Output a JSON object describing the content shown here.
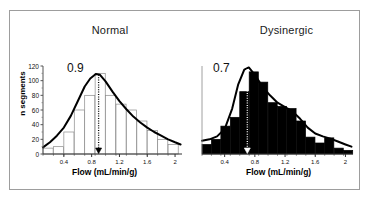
{
  "figure": {
    "background": "#ffffff",
    "border_color": "#9d9d9d"
  },
  "chart_data": [
    {
      "type": "bar",
      "title": "Normal",
      "xlabel": "Flow (mL/min/g)",
      "ylabel": "n segments",
      "xlim": [
        0.1,
        2.1
      ],
      "ylim": [
        0,
        120
      ],
      "xticks": [
        "0.4",
        "0.8",
        "1.2",
        "1.6",
        "2"
      ],
      "xtick_values": [
        0.4,
        0.8,
        1.2,
        1.6,
        2
      ],
      "yticks": [
        "0",
        "20",
        "40",
        "60",
        "80",
        "100",
        "120"
      ],
      "ytick_values": [
        0,
        20,
        40,
        60,
        80,
        100,
        120
      ],
      "grid": false,
      "legend": "none",
      "bar_fill": "#ffffff",
      "bar_edge": "#8a8a8a",
      "bin_width": 0.15,
      "bin_starts": [
        0.1,
        0.25,
        0.4,
        0.55,
        0.7,
        0.85,
        1.0,
        1.15,
        1.3,
        1.45,
        1.6,
        1.75,
        1.9
      ],
      "categories": [
        "0.10-0.25",
        "0.25-0.40",
        "0.40-0.55",
        "0.55-0.70",
        "0.70-0.85",
        "0.85-1.00",
        "1.00-1.15",
        "1.15-1.30",
        "1.30-1.45",
        "1.45-1.60",
        "1.60-1.75",
        "1.75-1.90",
        "1.90-2.05"
      ],
      "values": [
        8,
        10,
        30,
        60,
        80,
        110,
        80,
        68,
        60,
        45,
        32,
        20,
        13
      ],
      "curve": {
        "name": "smoothed distribution",
        "color": "#000000",
        "x": [
          0.1,
          0.2,
          0.3,
          0.4,
          0.5,
          0.6,
          0.7,
          0.78,
          0.86,
          0.92,
          1.0,
          1.1,
          1.2,
          1.3,
          1.4,
          1.5,
          1.6,
          1.7,
          1.8,
          1.9,
          2.0,
          2.08
        ],
        "y": [
          9,
          16,
          25,
          36,
          52,
          72,
          92,
          103,
          109,
          108,
          99,
          85,
          72,
          61,
          51,
          43,
          36,
          30,
          25,
          20,
          16,
          13
        ]
      },
      "annotation": {
        "label": "0.9",
        "marker": "dotted-arrow-down",
        "x_value": 0.9,
        "color": "#000000",
        "fill": "black"
      }
    },
    {
      "type": "bar",
      "title": "Dysinergic",
      "xlabel": "Flow (mL/min/g)",
      "ylabel": "",
      "xlim": [
        0.1,
        2.1
      ],
      "ylim": [
        0,
        120
      ],
      "xticks": [
        "0.4",
        "0.8",
        "1.2",
        "1.6",
        "2"
      ],
      "xtick_values": [
        0.4,
        0.8,
        1.2,
        1.6,
        2
      ],
      "yticks": [],
      "ytick_values": [
        0,
        20,
        40,
        60,
        80,
        100,
        120
      ],
      "grid": false,
      "legend": "none",
      "bar_fill": "#000000",
      "bar_edge": "#000000",
      "bin_width": 0.125,
      "bin_starts": [
        0.1,
        0.225,
        0.35,
        0.475,
        0.6,
        0.725,
        0.85,
        0.975,
        1.1,
        1.225,
        1.35,
        1.475,
        1.6,
        1.725,
        1.85,
        1.975
      ],
      "categories": [
        "0.10-0.23",
        "0.23-0.35",
        "0.35-0.48",
        "0.48-0.60",
        "0.60-0.73",
        "0.73-0.85",
        "0.85-0.98",
        "0.98-1.10",
        "1.10-1.23",
        "1.23-1.35",
        "1.35-1.48",
        "1.48-1.60",
        "1.60-1.73",
        "1.73-1.85",
        "1.85-1.98",
        "1.98-2.10"
      ],
      "values": [
        13,
        20,
        38,
        50,
        85,
        112,
        98,
        70,
        65,
        62,
        45,
        23,
        15,
        22,
        8,
        5
      ],
      "curve": {
        "name": "smoothed distribution",
        "color": "#000000",
        "x": [
          0.1,
          0.2,
          0.3,
          0.4,
          0.5,
          0.58,
          0.66,
          0.72,
          0.8,
          0.9,
          1.0,
          1.1,
          1.2,
          1.3,
          1.4,
          1.5,
          1.6,
          1.7,
          1.8,
          1.9,
          2.0,
          2.08
        ],
        "y": [
          18,
          20,
          24,
          34,
          62,
          95,
          115,
          118,
          108,
          92,
          80,
          70,
          64,
          58,
          48,
          36,
          28,
          24,
          21,
          17,
          13,
          10
        ]
      },
      "annotation": {
        "label": "0.7",
        "marker": "dotted-arrow-down",
        "x_value": 0.7,
        "color": "#ffffff",
        "fill": "white"
      }
    }
  ]
}
